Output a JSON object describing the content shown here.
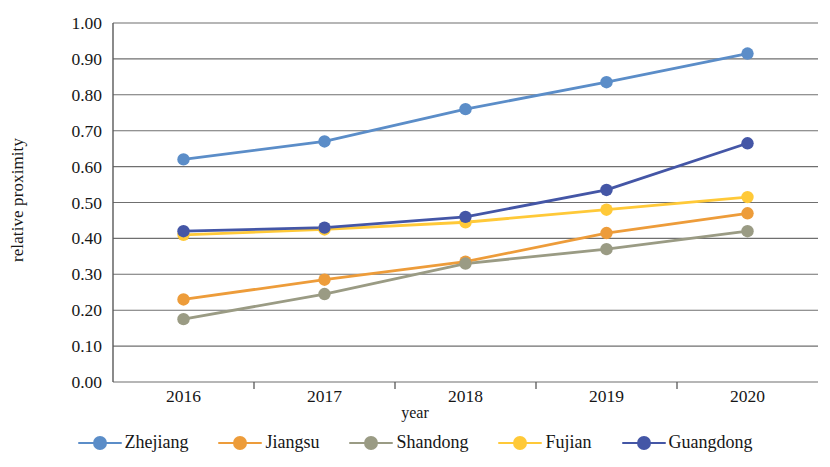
{
  "chart_data": {
    "type": "line",
    "title": "",
    "xlabel": "year",
    "ylabel": "relative proximity",
    "categories": [
      "2016",
      "2017",
      "2018",
      "2019",
      "2020"
    ],
    "x": [
      2016,
      2017,
      2018,
      2019,
      2020
    ],
    "ylim": [
      0.0,
      1.0
    ],
    "ytick_labels": [
      "0.00",
      "0.10",
      "0.20",
      "0.30",
      "0.40",
      "0.50",
      "0.60",
      "0.70",
      "0.80",
      "0.90",
      "1.00"
    ],
    "ytick_values": [
      0.0,
      0.1,
      0.2,
      0.3,
      0.4,
      0.5,
      0.6,
      0.7,
      0.8,
      0.9,
      1.0
    ],
    "grid": true,
    "grid_axis": "y",
    "legend_position": "bottom",
    "markers": "circle",
    "series": [
      {
        "name": "Zhejiang",
        "color": "#5B8DC8",
        "values": [
          0.62,
          0.67,
          0.76,
          0.835,
          0.915
        ]
      },
      {
        "name": "Jiangsu",
        "color": "#ED9C3A",
        "values": [
          0.23,
          0.285,
          0.335,
          0.415,
          0.47
        ]
      },
      {
        "name": "Shandong",
        "color": "#9A9B84",
        "values": [
          0.175,
          0.245,
          0.33,
          0.37,
          0.42
        ]
      },
      {
        "name": "Fujian",
        "color": "#FFC938",
        "values": [
          0.41,
          0.425,
          0.445,
          0.48,
          0.515
        ]
      },
      {
        "name": "Guangdong",
        "color": "#4456A6",
        "values": [
          0.42,
          0.43,
          0.46,
          0.535,
          0.665
        ]
      }
    ]
  },
  "axes": {
    "y_title": "relative proximity",
    "x_title": "year"
  },
  "colors": {
    "axis_line": "#595959",
    "grid_line": "#6f6f6f",
    "text": "#161616",
    "background": "#ffffff"
  }
}
